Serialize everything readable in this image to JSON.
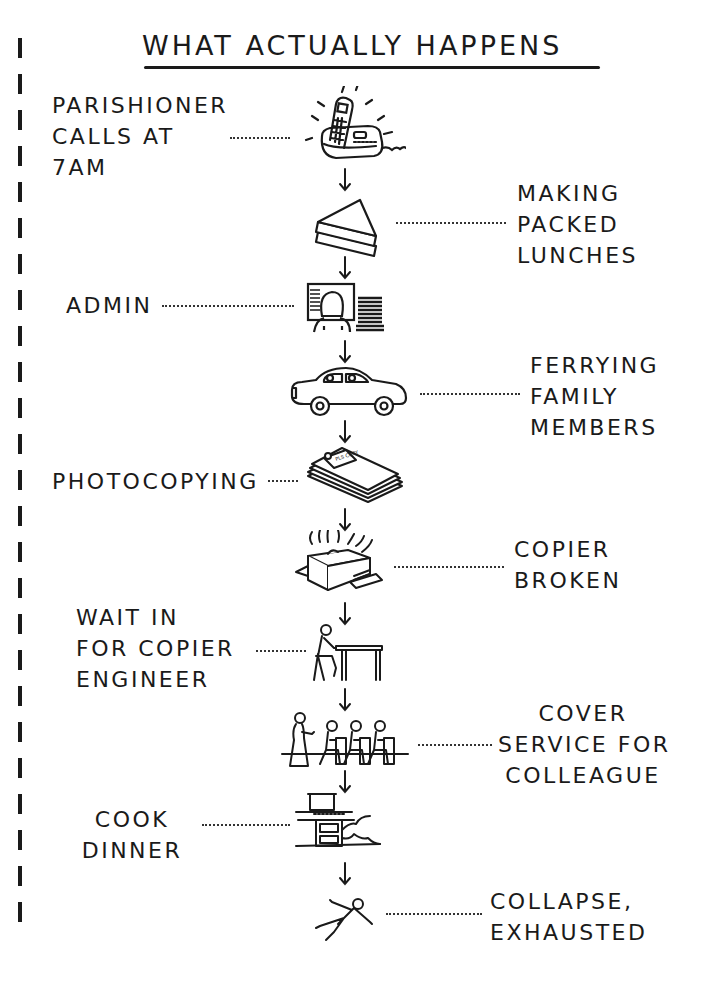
{
  "title": "WHAT ACTUALLY HAPPENS",
  "steps": [
    {
      "label": "PARISHIONER\nCALLS AT\n7AM",
      "icon": "telephone-ringing-icon",
      "side": "left"
    },
    {
      "label": "MAKING\nPACKED\nLUNCHES",
      "icon": "sandwich-icon",
      "side": "right"
    },
    {
      "label": "ADMIN",
      "icon": "computer-desk-icon",
      "side": "left"
    },
    {
      "label": "FERRYING\nFAMILY\nMEMBERS",
      "icon": "car-icon",
      "side": "right"
    },
    {
      "label": "PHOTOCOPYING",
      "icon": "paper-stack-icon",
      "side": "left"
    },
    {
      "label": "COPIER\nBROKEN",
      "icon": "broken-copier-icon",
      "side": "right"
    },
    {
      "label": "WAIT IN\nFOR COPIER\nENGINEER",
      "icon": "person-at-table-icon",
      "side": "left"
    },
    {
      "label": "COVER\nSERVICE FOR\nCOLLEAGUE",
      "icon": "congregation-icon",
      "side": "right"
    },
    {
      "label": "COOK\nDINNER",
      "icon": "stove-icon",
      "side": "left"
    },
    {
      "label": "COLLAPSE,\nEXHAUSTED",
      "icon": "collapsed-person-icon",
      "side": "right"
    }
  ],
  "paper_label": "PLS COPY"
}
